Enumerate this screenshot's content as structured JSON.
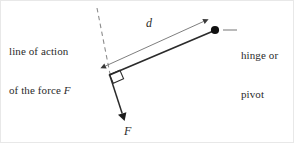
{
  "figure": {
    "width": 294,
    "height": 143,
    "background": "#ffffff",
    "stroke_color": "#2b2b2b",
    "dashed_color": "#8c8c8c",
    "thin_color": "#6f6f6f",
    "text_color": "#2b2b2b"
  },
  "labels": {
    "line_of_action_line1": "line of action",
    "line_of_action_line2_prefix": "of the force ",
    "line_of_action_line2_var": "F",
    "hinge_line1": "hinge or",
    "hinge_line2": "pivot",
    "distance_var": "d",
    "force_var": "F"
  },
  "geometry": {
    "line_of_action": {
      "x1": 96,
      "y1": 7,
      "x2": 109,
      "y2": 73,
      "style": "dashed"
    },
    "lever_arm": {
      "x1": 108,
      "y1": 74,
      "x2": 214,
      "y2": 29,
      "style": "solid-thick"
    },
    "distance_arrow": {
      "x1": 104,
      "y1": 65,
      "x2": 203,
      "y2": 20,
      "style": "double-headed-thin"
    },
    "force_arrow": {
      "x1": 108,
      "y1": 73,
      "x2": 123,
      "y2": 119,
      "style": "solid-arrow"
    },
    "right_angle_marker": {
      "x": 108,
      "y": 73,
      "size": 11
    },
    "pivot_point": {
      "x": 214,
      "y": 29,
      "radius": 4
    },
    "hinge_leader": {
      "x1": 222,
      "y1": 29,
      "x2": 236,
      "y2": 29
    }
  }
}
